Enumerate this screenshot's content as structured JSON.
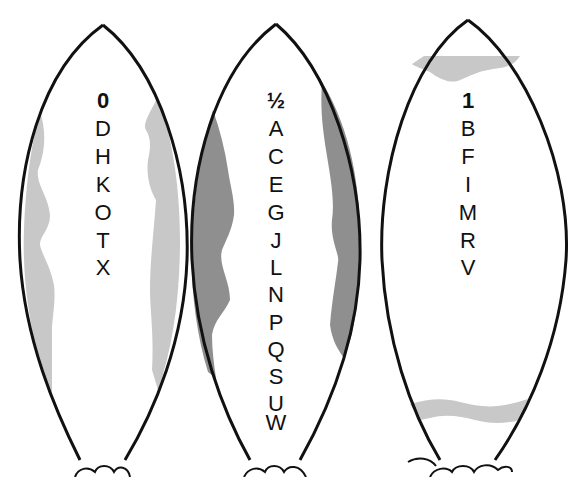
{
  "diagram": {
    "columns": [
      {
        "id": "zero",
        "header": "0",
        "letters": [
          "D",
          "H",
          "K",
          "O",
          "T",
          "X"
        ],
        "shading": "light-gray vertical bands on both sides"
      },
      {
        "id": "half",
        "header": "½",
        "letters": [
          "A",
          "C",
          "E",
          "G",
          "J",
          "L",
          "N",
          "P",
          "Q",
          "S",
          "U",
          "W"
        ],
        "shading": "dark-gray vertical bands on both sides"
      },
      {
        "id": "one",
        "header": "1",
        "letters": [
          "B",
          "F",
          "I",
          "M",
          "R",
          "V"
        ],
        "shading": "light-gray horizontal bands at top and bottom"
      }
    ],
    "colors": {
      "outline": "#111111",
      "light_shade": "#c8c8c8",
      "dark_shade": "#8f8f8f",
      "background": "#ffffff"
    }
  }
}
